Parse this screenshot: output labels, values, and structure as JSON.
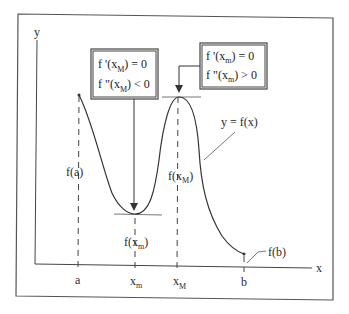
{
  "diagram": {
    "axes": {
      "x_label": "x",
      "y_label": "y"
    },
    "x_ticks": [
      {
        "label": "a",
        "sub": ""
      },
      {
        "label": "x",
        "sub": "m"
      },
      {
        "label": "x",
        "sub": "M"
      },
      {
        "label": "b",
        "sub": ""
      }
    ],
    "point_labels": {
      "fa": "f(a)",
      "fxm_base": "f(x",
      "fxm_sub": "m",
      "fxm_close": ")",
      "fxM_base": "f(x",
      "fxM_sub": "M",
      "fxM_close": ")",
      "fb": "f(b)",
      "curve": "y = f(x)"
    },
    "box_left": {
      "line1_base": "f '(x",
      "line1_sub": "M",
      "line1_rest": ") = 0",
      "line2_base": "f \"(x",
      "line2_sub": "M",
      "line2_rest": ") < 0"
    },
    "box_right": {
      "line1_base": "f '(x",
      "line1_sub": "m",
      "line1_rest": ") = 0",
      "line2_base": "f \"(x",
      "line2_sub": "m",
      "line2_rest": ") > 0"
    },
    "colors": {
      "line": "#333333",
      "frame": "#555555",
      "background": "#ffffff"
    }
  }
}
